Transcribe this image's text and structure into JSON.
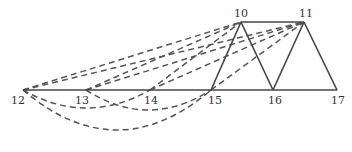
{
  "diagram": {
    "type": "truss-graph",
    "colors": {
      "solid": "#444444",
      "dashed": "#555555",
      "label": "#333333"
    },
    "nodes": [
      {
        "id": "10",
        "x": 241,
        "y": 22,
        "lx": 241,
        "ly": 17
      },
      {
        "id": "11",
        "x": 304,
        "y": 22,
        "lx": 306,
        "ly": 17
      },
      {
        "id": "12",
        "x": 23,
        "y": 90,
        "lx": 18,
        "ly": 104
      },
      {
        "id": "13",
        "x": 86,
        "y": 90,
        "lx": 82,
        "ly": 104
      },
      {
        "id": "14",
        "x": 150,
        "y": 90,
        "lx": 151,
        "ly": 104
      },
      {
        "id": "15",
        "x": 211,
        "y": 90,
        "lx": 215,
        "ly": 104
      },
      {
        "id": "16",
        "x": 273,
        "y": 90,
        "lx": 275,
        "ly": 104
      },
      {
        "id": "17",
        "x": 337,
        "y": 90,
        "lx": 338,
        "ly": 104
      }
    ],
    "solid_edges": [
      [
        "12",
        "13"
      ],
      [
        "13",
        "14"
      ],
      [
        "14",
        "15"
      ],
      [
        "15",
        "16"
      ],
      [
        "16",
        "17"
      ],
      [
        "10",
        "11"
      ],
      [
        "10",
        "15"
      ],
      [
        "10",
        "16"
      ],
      [
        "11",
        "16"
      ],
      [
        "11",
        "17"
      ]
    ],
    "dashed_edges": [
      [
        "12",
        "10"
      ],
      [
        "12",
        "11"
      ],
      [
        "13",
        "10"
      ],
      [
        "13",
        "11"
      ],
      [
        "14",
        "10"
      ],
      [
        "14",
        "11"
      ],
      [
        "15",
        "11"
      ]
    ],
    "dashed_arcs": [
      {
        "from": "12",
        "to": "14",
        "depth": 18
      },
      {
        "from": "13",
        "to": "15",
        "depth": 20
      },
      {
        "from": "12",
        "to": "15",
        "depth": 40
      }
    ]
  }
}
